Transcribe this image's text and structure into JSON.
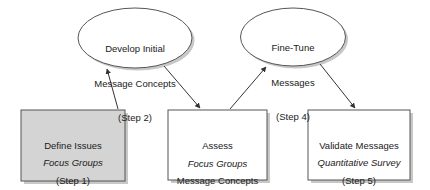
{
  "diagram": {
    "background_color": "#ffffff",
    "stroke_color": "#555555",
    "text_color": "#1a1a1a",
    "shadow_color": "#c8c8c8",
    "box_fill_gray": "#d4d4d4",
    "box_fill_white": "#ffffff",
    "nodes": [
      {
        "id": "step2",
        "shape": "ellipse",
        "line1": "Develop Initial",
        "line2": "Message Concepts",
        "line3": "(Step 2)",
        "fill": "#ffffff"
      },
      {
        "id": "step4",
        "shape": "ellipse",
        "line1": "Fine-Tune",
        "line2": "Messages",
        "line3": "(Step 4)",
        "fill": "#ffffff"
      },
      {
        "id": "step1",
        "shape": "box",
        "line1": "Define Issues",
        "line2": "(Step 1)",
        "method": "Focus Groups",
        "fill": "#d4d4d4"
      },
      {
        "id": "step3",
        "shape": "box",
        "line1": "Assess",
        "line2": "Message Concepts",
        "line3": "(Step 3)",
        "method": "Focus Groups",
        "fill": "#ffffff"
      },
      {
        "id": "step5",
        "shape": "box",
        "line1": "Validate Messages",
        "line2": "(Step 5)",
        "method": "Quantitative Survey",
        "fill": "#ffffff"
      }
    ],
    "connectors": [
      {
        "id": "step1-to-step2",
        "from": "step1",
        "to": "step2",
        "arrowhead": "filled-triangle"
      },
      {
        "id": "step2-to-step3",
        "from": "step2",
        "to": "step3",
        "arrowhead": "filled-triangle"
      },
      {
        "id": "step3-to-step4",
        "from": "step3",
        "to": "step4",
        "arrowhead": "filled-triangle"
      },
      {
        "id": "step4-to-step5",
        "from": "step4",
        "to": "step5",
        "arrowhead": "filled-triangle"
      }
    ]
  }
}
